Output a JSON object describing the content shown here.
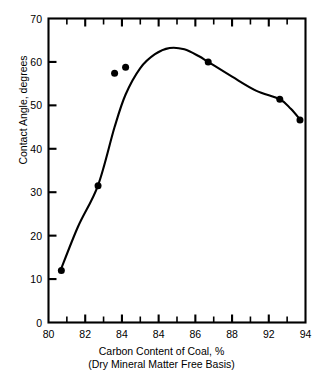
{
  "chart_data": {
    "type": "line",
    "title": "",
    "xlabel": "Carbon Content of Coal, %",
    "xlabel_sub": "(Dry Mineral Matter Free Basis)",
    "ylabel": "Contact Angle, degrees",
    "xlim": [
      80,
      94
    ],
    "ylim": [
      0,
      70
    ],
    "grid": false,
    "legend": "none",
    "x_major_step": 2,
    "x_minor_step": 1,
    "y_major_step": 10,
    "x_tick_labels": [
      "80",
      "82",
      "84",
      "84",
      "86",
      "88",
      "92",
      "94"
    ],
    "x_tick_values": [
      80,
      82,
      84,
      86,
      88,
      90,
      92,
      94
    ],
    "y_tick_labels": [
      "0",
      "10",
      "20",
      "30",
      "40",
      "50",
      "60",
      "70"
    ],
    "y_tick_values": [
      0,
      10,
      20,
      30,
      40,
      50,
      60,
      70
    ],
    "series": [
      {
        "name": "Contact angle vs carbon content",
        "marker": "filled-circle",
        "line": "smooth-fitted-curve",
        "color": "#000000",
        "x": [
          80.7,
          82.7,
          83.6,
          84.2,
          88.7,
          92.6,
          93.7
        ],
        "y": [
          12.0,
          31.5,
          57.4,
          58.8,
          60.0,
          51.4,
          46.6
        ]
      }
    ],
    "fitted_curve_peak": {
      "x": 86.6,
      "y": 63.2
    }
  }
}
